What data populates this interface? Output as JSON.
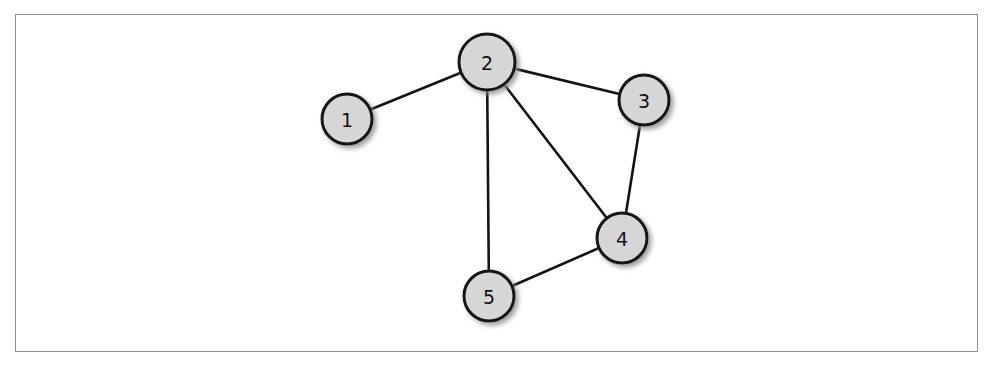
{
  "figure": {
    "kind": "undirected-graph-diagram",
    "background_color": "#ffffff",
    "frame": {
      "visible": true,
      "color": "#8f8f93",
      "x": 15,
      "y": 14,
      "width": 963,
      "height": 338
    }
  },
  "graph": {
    "node_fill_color": "#d6d6d6",
    "node_stroke_color": "#141414",
    "node_stroke_width": 3,
    "edge_color": "#141414",
    "edge_width": 2.6,
    "label_color": "#111111",
    "shadow_color": "#9a9a9a",
    "nodes": [
      {
        "id": "1",
        "label": "1",
        "cx": 347,
        "cy": 119,
        "r": 25
      },
      {
        "id": "2",
        "label": "2",
        "cx": 487,
        "cy": 62,
        "r": 28
      },
      {
        "id": "3",
        "label": "3",
        "cx": 644,
        "cy": 100,
        "r": 25
      },
      {
        "id": "4",
        "label": "4",
        "cx": 622,
        "cy": 238,
        "r": 25
      },
      {
        "id": "5",
        "label": "5",
        "cx": 489,
        "cy": 296,
        "r": 25
      }
    ],
    "edges": [
      {
        "from": "1",
        "to": "2"
      },
      {
        "from": "2",
        "to": "3"
      },
      {
        "from": "2",
        "to": "4"
      },
      {
        "from": "2",
        "to": "5"
      },
      {
        "from": "3",
        "to": "4"
      },
      {
        "from": "4",
        "to": "5"
      }
    ]
  }
}
